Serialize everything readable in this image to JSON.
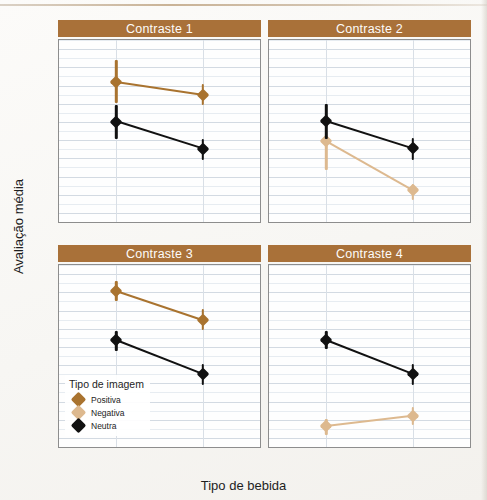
{
  "figure": {
    "y_axis_title": "Avaliação média",
    "x_axis_title": "Tipo de bebida",
    "strip_color": "#a97139",
    "strip_text_color": "#fdfcfa"
  },
  "legend": {
    "title": "Tipo de imagem",
    "items": [
      {
        "label": "Positiva",
        "color": "#a9732f"
      },
      {
        "label": "Negativa",
        "color": "#ddb98f"
      },
      {
        "label": "Neutra",
        "color": "#111111"
      }
    ]
  },
  "chart_data": {
    "type": "line",
    "title": "",
    "subtitle": "",
    "xlabel": "Tipo de bebida",
    "ylabel": "Avaliação média",
    "ylim": [
      -17.5,
      32.5
    ],
    "yticks": [
      30,
      25,
      20,
      15,
      10,
      5,
      0,
      -5,
      -10,
      -15
    ],
    "ytick_labels": [
      "30",
      "25",
      "20",
      "15",
      "10",
      "5",
      "0",
      "−5",
      "−10",
      "−15"
    ],
    "grid": {
      "major_y": true,
      "minor_y": true,
      "vertical_at_categories": true
    },
    "legend_position": "inside-bottom-left-panel-3",
    "facets": [
      {
        "name": "Contraste 1",
        "categories": [
          "Cerveja",
          "Água"
        ],
        "series": [
          {
            "name": "Positiva",
            "color": "#a9732f",
            "values": [
              21.0,
              17.5
            ],
            "ci_low": [
              15.2,
              14.7
            ],
            "ci_high": [
              27.0,
              20.4
            ]
          },
          {
            "name": "Neutra",
            "color": "#111111",
            "values": [
              10.1,
              2.6
            ],
            "ci_low": [
              5.3,
              -0.5
            ],
            "ci_high": [
              14.6,
              5.4
            ]
          }
        ]
      },
      {
        "name": "Contraste 2",
        "categories": [
          "Cerveja",
          "Água"
        ],
        "series": [
          {
            "name": "Negativa",
            "color": "#ddb98f",
            "values": [
              4.7,
              -8.8
            ],
            "ci_low": [
              -3.1,
              -11.4
            ],
            "ci_high": [
              5.6,
              -7.1
            ]
          },
          {
            "name": "Neutra",
            "color": "#111111",
            "values": [
              10.2,
              2.7
            ],
            "ci_low": [
              5.4,
              -0.4
            ],
            "ci_high": [
              14.9,
              5.5
            ]
          }
        ]
      },
      {
        "name": "Contraste 3",
        "categories": [
          "Vinho",
          "Água"
        ],
        "series": [
          {
            "name": "Positiva",
            "color": "#a9732f",
            "values": [
              25.4,
              17.4
            ],
            "ci_low": [
              22.5,
              14.6
            ],
            "ci_high": [
              28.2,
              20.3
            ]
          },
          {
            "name": "Neutra",
            "color": "#111111",
            "values": [
              11.8,
              2.5
            ],
            "ci_low": [
              8.9,
              -0.6
            ],
            "ci_high": [
              14.4,
              5.3
            ]
          }
        ]
      },
      {
        "name": "Contraste 4",
        "categories": [
          "Vinho",
          "Água"
        ],
        "series": [
          {
            "name": "Negativa",
            "color": "#ddb98f",
            "values": [
              -11.8,
              -9.0
            ],
            "ci_low": [
              -14.1,
              -11.5
            ],
            "ci_high": [
              -9.7,
              -6.6
            ]
          },
          {
            "name": "Neutra",
            "color": "#111111",
            "values": [
              11.9,
              2.6
            ],
            "ci_low": [
              9.3,
              -0.5
            ],
            "ci_high": [
              14.5,
              5.4
            ]
          }
        ]
      }
    ]
  }
}
